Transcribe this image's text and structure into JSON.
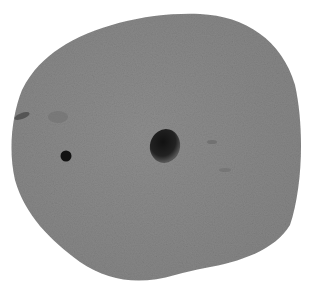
{
  "image": {
    "subject": "Grey porous stone with two holes",
    "description": "Rounded grey pebble on a white background with one large hole near center and one small hole on the left",
    "colors": {
      "background": "#ffffff",
      "stone": "#8b8b8b",
      "stone_dark": "#7a7a7a",
      "hole": "#1a1a1a"
    }
  }
}
